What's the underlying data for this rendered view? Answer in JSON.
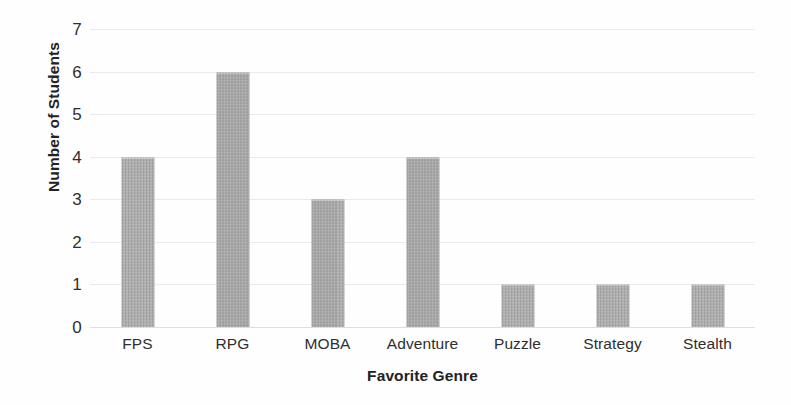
{
  "chart_data": {
    "type": "bar",
    "title": "",
    "xlabel": "Favorite Genre",
    "ylabel": "Number of Students",
    "categories": [
      "FPS",
      "RPG",
      "MOBA",
      "Adventure",
      "Puzzle",
      "Strategy",
      "Stealth"
    ],
    "values": [
      4,
      6,
      3,
      4,
      1,
      1,
      1
    ],
    "ylim": [
      0,
      7
    ],
    "ytick_labels": [
      "7",
      "6",
      "5",
      "4",
      "3",
      "2",
      "1",
      "0"
    ],
    "ytick_values": [
      7,
      6,
      5,
      4,
      3,
      2,
      1,
      0
    ],
    "grid": true,
    "legend": false,
    "legend_position": "none",
    "bar_color": "#a8a8a8",
    "gridline_color": "#e9e9e9",
    "axis_label_color": "#222222",
    "tick_label_color": "#2e2e2e",
    "background_color": "#fefefe"
  }
}
